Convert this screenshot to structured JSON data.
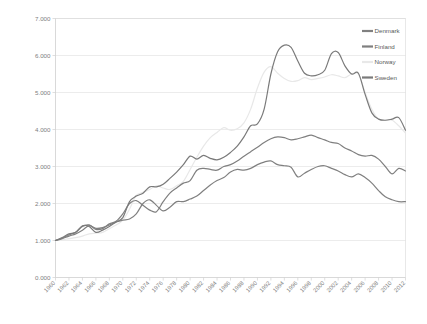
{
  "chart_data": {
    "type": "line",
    "title": "",
    "xlabel": "",
    "ylabel": "",
    "ylim": [
      0,
      7
    ],
    "grid": true,
    "legend_position": "top-right",
    "ytick_labels": [
      "7.000",
      "6.000",
      "5.000",
      "4.000",
      "3.000",
      "2.000",
      "1.000",
      "0.000"
    ],
    "ytick_values": [
      7,
      6,
      5,
      4,
      3,
      2,
      1,
      0
    ],
    "xtick_labels": [
      "1960",
      "1962",
      "1964",
      "1966",
      "1968",
      "1970",
      "1972",
      "1974",
      "1976",
      "1978",
      "1980",
      "1982",
      "1984",
      "1986",
      "1988",
      "1990",
      "1992",
      "1994",
      "1996",
      "1998",
      "2000",
      "2002",
      "2004",
      "2006",
      "2008",
      "2010",
      "2012"
    ],
    "x": [
      1960,
      1961,
      1962,
      1963,
      1964,
      1965,
      1966,
      1967,
      1968,
      1969,
      1970,
      1971,
      1972,
      1973,
      1974,
      1975,
      1976,
      1977,
      1978,
      1979,
      1980,
      1981,
      1982,
      1983,
      1984,
      1985,
      1986,
      1987,
      1988,
      1989,
      1990,
      1991,
      1992,
      1993,
      1994,
      1995,
      1996,
      1997,
      1998,
      1999,
      2000,
      2001,
      2002,
      2003,
      2004,
      2005,
      2006,
      2007,
      2008,
      2009,
      2010,
      2011,
      2012
    ],
    "series": [
      {
        "name": "Denmark",
        "color": "#808080",
        "values": [
          1.0,
          1.05,
          1.12,
          1.18,
          1.28,
          1.4,
          1.33,
          1.35,
          1.42,
          1.5,
          1.55,
          1.58,
          1.72,
          2.0,
          2.1,
          1.95,
          1.8,
          1.9,
          2.05,
          2.05,
          2.12,
          2.2,
          2.35,
          2.5,
          2.62,
          2.7,
          2.85,
          2.92,
          2.9,
          2.95,
          3.05,
          3.12,
          3.15,
          3.05,
          3.02,
          2.98,
          2.72,
          2.82,
          2.92,
          3.0,
          3.02,
          2.95,
          2.88,
          2.78,
          2.72,
          2.8,
          2.7,
          2.55,
          2.35,
          2.18,
          2.1,
          2.05,
          2.05
        ]
      },
      {
        "name": "Finland",
        "color": "#7f7f7f",
        "values": [
          1.0,
          1.06,
          1.15,
          1.22,
          1.38,
          1.42,
          1.3,
          1.32,
          1.45,
          1.52,
          1.72,
          2.0,
          2.08,
          1.95,
          1.82,
          1.78,
          2.05,
          2.28,
          2.42,
          2.55,
          2.62,
          2.9,
          2.95,
          2.92,
          2.9,
          3.0,
          3.05,
          3.15,
          3.28,
          3.4,
          3.52,
          3.65,
          3.75,
          3.8,
          3.78,
          3.72,
          3.75,
          3.8,
          3.85,
          3.78,
          3.72,
          3.65,
          3.62,
          3.5,
          3.42,
          3.32,
          3.28,
          3.3,
          3.2,
          3.0,
          2.8,
          2.95,
          2.88
        ]
      },
      {
        "name": "Norway",
        "color": "#e8e8e8",
        "values": [
          1.0,
          1.02,
          1.05,
          1.08,
          1.12,
          1.18,
          1.2,
          1.22,
          1.32,
          1.42,
          1.55,
          1.85,
          2.22,
          2.3,
          2.38,
          2.48,
          2.42,
          2.38,
          2.48,
          2.6,
          2.92,
          3.25,
          3.55,
          3.78,
          3.92,
          4.05,
          3.98,
          4.02,
          4.18,
          4.55,
          5.12,
          5.55,
          5.7,
          5.52,
          5.38,
          5.3,
          5.32,
          5.4,
          5.35,
          5.38,
          5.42,
          5.48,
          5.45,
          5.4,
          5.5,
          5.5,
          5.0,
          4.55,
          4.28,
          4.25,
          4.25,
          4.1,
          3.9
        ]
      },
      {
        "name": "Sweden",
        "color": "#7a7a7a",
        "values": [
          1.0,
          1.08,
          1.18,
          1.22,
          1.4,
          1.38,
          1.22,
          1.28,
          1.38,
          1.5,
          1.62,
          2.05,
          2.2,
          2.28,
          2.45,
          2.45,
          2.52,
          2.68,
          2.85,
          3.05,
          3.28,
          3.2,
          3.3,
          3.22,
          3.18,
          3.25,
          3.38,
          3.55,
          3.8,
          4.1,
          4.15,
          4.55,
          5.5,
          6.1,
          6.28,
          6.22,
          5.85,
          5.52,
          5.45,
          5.48,
          5.6,
          6.05,
          6.08,
          5.72,
          5.5,
          5.52,
          4.95,
          4.45,
          4.28,
          4.25,
          4.28,
          4.32,
          3.98
        ]
      }
    ],
    "legend": [
      {
        "label": "Denmark",
        "color": "#808080",
        "swatch": "line"
      },
      {
        "label": "Finland",
        "color": "#7f7f7f",
        "swatch": "line"
      },
      {
        "label": "Norway",
        "color": "#e8e8e8",
        "swatch": "line"
      },
      {
        "label": "Sweden",
        "color": "#7a7a7a",
        "swatch": "line"
      }
    ]
  }
}
